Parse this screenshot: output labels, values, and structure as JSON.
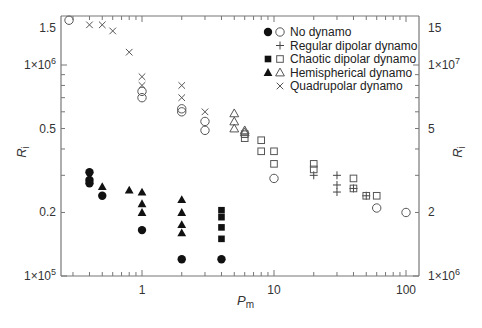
{
  "chart_data": {
    "type": "scatter",
    "title": "",
    "xlabel": "Pm",
    "xlabel_sub": "m",
    "ylabel": "Ri",
    "ylabel_sub": "i",
    "xscale": "log",
    "yscale": "log",
    "xlim": [
      0.25,
      120
    ],
    "ylim_left": [
      100000,
      1710000
    ],
    "ylim_right": [
      1000000,
      17100000
    ],
    "grid": false,
    "legend_position": "upper right (inside)",
    "x_ticks": [
      {
        "value": 1,
        "label": "1"
      },
      {
        "value": 10,
        "label": "10"
      },
      {
        "value": 100,
        "label": "100"
      }
    ],
    "y_left_ticks": [
      {
        "value": 100000,
        "label": "1×10",
        "exp": "5"
      },
      {
        "value": 200000,
        "label": "0.2",
        "exp": ""
      },
      {
        "value": 500000,
        "label": "0.5",
        "exp": ""
      },
      {
        "value": 1000000,
        "label": "1×10",
        "exp": "6"
      },
      {
        "value": 1500000,
        "label": "1.5",
        "exp": ""
      }
    ],
    "y_right_ticks": [
      {
        "value": 1000000,
        "label": "1×10",
        "exp": "6"
      },
      {
        "value": 2000000,
        "label": "2",
        "exp": ""
      },
      {
        "value": 5000000,
        "label": "5",
        "exp": ""
      },
      {
        "value": 10000000,
        "label": "1×10",
        "exp": "7"
      },
      {
        "value": 15000000,
        "label": "15",
        "exp": ""
      }
    ],
    "legend": [
      {
        "label": "No dynamo",
        "markers": [
          "filled-circle",
          "open-circle"
        ]
      },
      {
        "label": "Regular dipolar dynamo",
        "markers": [
          "plus"
        ]
      },
      {
        "label": "Chaotic dipolar dynamo",
        "markers": [
          "filled-square",
          "open-square"
        ]
      },
      {
        "label": "Hemispherical dynamo",
        "markers": [
          "filled-triangle",
          "open-triangle"
        ]
      },
      {
        "label": "Quadrupolar dynamo",
        "markers": [
          "cross"
        ]
      }
    ],
    "series": [
      {
        "name": "No dynamo (left axis)",
        "marker": "filled-circle",
        "axis": "left",
        "points": [
          [
            0.4,
            310000
          ],
          [
            0.4,
            285000
          ],
          [
            0.4,
            275000
          ],
          [
            0.5,
            240000
          ],
          [
            1,
            165000
          ],
          [
            2,
            120000
          ],
          [
            4,
            120000
          ]
        ]
      },
      {
        "name": "No dynamo (right axis)",
        "marker": "open-circle",
        "axis": "right",
        "points": [
          [
            0.28,
            16300000
          ],
          [
            1,
            7500000
          ],
          [
            1,
            7000000
          ],
          [
            2,
            6200000
          ],
          [
            2,
            6000000
          ],
          [
            3,
            5400000
          ],
          [
            3,
            4900000
          ],
          [
            10,
            2900000
          ],
          [
            60,
            2100000
          ],
          [
            100,
            2000000
          ]
        ]
      },
      {
        "name": "Regular dipolar dynamo",
        "marker": "plus",
        "axis": "right",
        "points": [
          [
            20,
            3000000
          ],
          [
            30,
            3000000
          ],
          [
            30,
            2700000
          ],
          [
            30,
            2500000
          ],
          [
            40,
            2600000
          ],
          [
            50,
            2400000
          ]
        ]
      },
      {
        "name": "Chaotic dipolar dynamo (left axis)",
        "marker": "filled-square",
        "axis": "left",
        "points": [
          [
            4,
            205000
          ],
          [
            4,
            190000
          ],
          [
            4,
            170000
          ],
          [
            4,
            150000
          ]
        ]
      },
      {
        "name": "Chaotic dipolar dynamo (right axis)",
        "marker": "open-square",
        "axis": "right",
        "points": [
          [
            6,
            4700000
          ],
          [
            6,
            4500000
          ],
          [
            8,
            4400000
          ],
          [
            8,
            3900000
          ],
          [
            10,
            3900000
          ],
          [
            10,
            3400000
          ],
          [
            20,
            3400000
          ],
          [
            20,
            3200000
          ],
          [
            40,
            2900000
          ],
          [
            40,
            2600000
          ],
          [
            50,
            2400000
          ],
          [
            60,
            2400000
          ]
        ]
      },
      {
        "name": "Hemispherical dynamo (left axis)",
        "marker": "filled-triangle",
        "axis": "left",
        "points": [
          [
            0.5,
            265000
          ],
          [
            0.8,
            255000
          ],
          [
            1,
            250000
          ],
          [
            1,
            220000
          ],
          [
            1,
            200000
          ],
          [
            2,
            230000
          ],
          [
            2,
            200000
          ],
          [
            2,
            175000
          ],
          [
            2,
            160000
          ]
        ]
      },
      {
        "name": "Hemispherical dynamo (right axis)",
        "marker": "open-triangle",
        "axis": "right",
        "points": [
          [
            5,
            5900000
          ],
          [
            5,
            5400000
          ],
          [
            5,
            5000000
          ],
          [
            6,
            4900000
          ],
          [
            6,
            4800000
          ]
        ]
      },
      {
        "name": "Quadrupolar dynamo",
        "marker": "cross",
        "axis": "right",
        "points": [
          [
            0.4,
            15500000
          ],
          [
            0.5,
            15500000
          ],
          [
            0.6,
            14500000
          ],
          [
            0.8,
            11500000
          ],
          [
            1,
            8800000
          ],
          [
            1,
            8000000
          ],
          [
            2,
            8000000
          ],
          [
            2,
            7000000
          ],
          [
            3,
            6000000
          ]
        ]
      }
    ]
  }
}
